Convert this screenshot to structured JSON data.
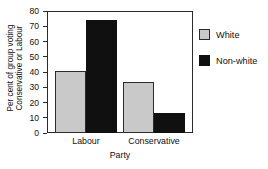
{
  "chart_data": {
    "type": "bar",
    "title": "",
    "categories": [
      "Labour",
      "Conservative"
    ],
    "series": [
      {
        "name": "White",
        "values": [
          40.5,
          33.5
        ],
        "color": "#c9c9c9"
      },
      {
        "name": "Non-white",
        "values": [
          74,
          13
        ],
        "color": "#101010"
      }
    ],
    "xlabel": "Party",
    "ylabel_line1": "Per cent of group voting",
    "ylabel_line2": "Conservative or Labour",
    "ylim": [
      0,
      80
    ],
    "yticks": [
      0,
      10,
      20,
      30,
      40,
      50,
      60,
      70,
      80
    ],
    "ytick_labels": [
      "0",
      "10",
      "20",
      "30",
      "40",
      "50",
      "60",
      "70",
      "80"
    ],
    "grid": false,
    "legend_position": "right",
    "legend": [
      "White",
      "Non-white"
    ]
  },
  "axis": {
    "frame_color": "#2b2b2b"
  }
}
